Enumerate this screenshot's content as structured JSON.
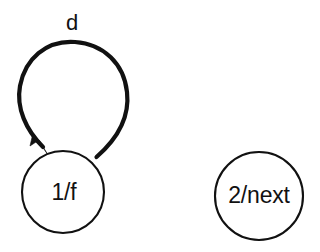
{
  "canvas": {
    "width": 320,
    "height": 252,
    "background": "#ffffff",
    "ink_color": "#111111"
  },
  "diagram": {
    "type": "state-transition-diagram",
    "states": [
      {
        "id": "state-1",
        "label": "1/f",
        "cx": 63,
        "cy": 192,
        "r": 41
      },
      {
        "id": "state-2",
        "label": "2/next",
        "cx": 259,
        "cy": 196,
        "r": 44
      }
    ],
    "edges": [
      {
        "id": "self-loop-d",
        "label": "d",
        "from": "state-1",
        "to": "state-1",
        "label_x": 72,
        "label_y": 24,
        "arrow": "filled-triangle"
      }
    ]
  }
}
